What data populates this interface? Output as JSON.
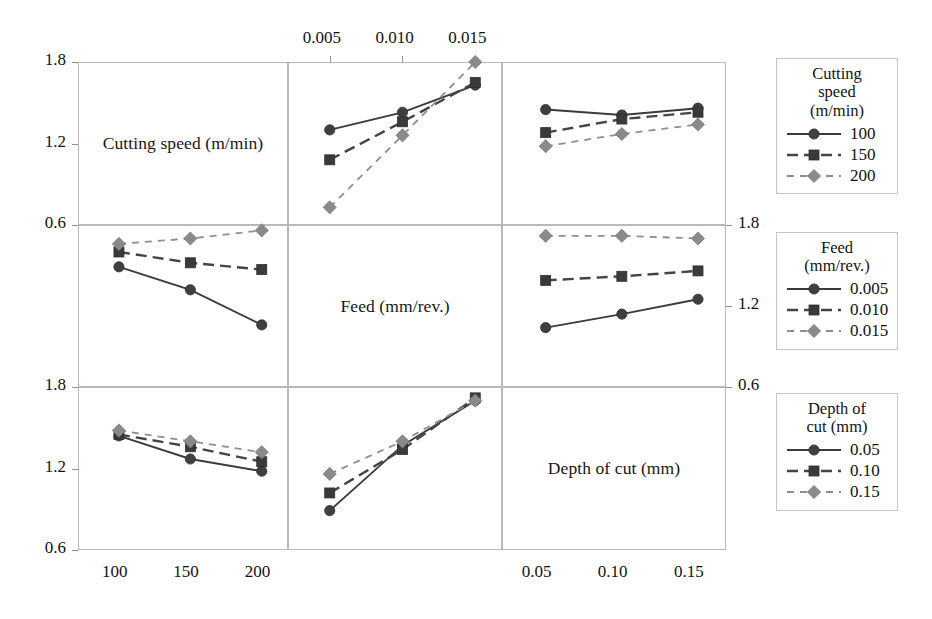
{
  "chart_data": {
    "type": "line",
    "title": "",
    "subtitle": "",
    "plot_kind": "interaction-matrix",
    "ylim": [
      0.6,
      1.8
    ],
    "yticks": [
      0.6,
      1.2,
      1.8
    ],
    "grid": true,
    "legend_position": "right",
    "factors": [
      {
        "key": "speed",
        "label": "Cutting speed (m/min)",
        "levels": [
          "100",
          "150",
          "200"
        ],
        "unit": "m/min"
      },
      {
        "key": "feed",
        "label": "Feed (mm/rev.)",
        "levels": [
          "0.005",
          "0.010",
          "0.015"
        ],
        "unit": "mm/rev."
      },
      {
        "key": "depth",
        "label": "Depth of cut (mm)",
        "levels": [
          "0.05",
          "0.10",
          "0.15"
        ],
        "unit": "mm"
      }
    ],
    "axes": {
      "top_ticks": [
        "0.005",
        "0.010",
        "0.015"
      ],
      "bottom_left_ticks": [
        "100",
        "150",
        "200"
      ],
      "bottom_right_ticks": [
        "0.05",
        "0.10",
        "0.15"
      ],
      "left_ticks_row1": [
        "1.8",
        "1.2",
        "0.6"
      ],
      "left_ticks_row3": [
        "1.8",
        "1.2",
        "0.6"
      ],
      "right_ticks_row2": [
        "1.8",
        "1.2",
        "0.6"
      ]
    },
    "panels": [
      {
        "row": 0,
        "col": 0,
        "kind": "diagonal",
        "label": "Cutting speed (m/min)"
      },
      {
        "row": 0,
        "col": 1,
        "kind": "interaction",
        "xlabel": "Feed (mm/rev.)",
        "x": [
          "0.005",
          "0.010",
          "0.015"
        ],
        "series": [
          {
            "name": "100",
            "style": "solid",
            "marker": "circle",
            "values": [
              1.3,
              1.43,
              1.63
            ]
          },
          {
            "name": "150",
            "style": "dashed",
            "marker": "square",
            "values": [
              1.08,
              1.36,
              1.65
            ]
          },
          {
            "name": "200",
            "style": "dotted",
            "marker": "diamond",
            "values": [
              0.73,
              1.26,
              1.8
            ]
          }
        ]
      },
      {
        "row": 0,
        "col": 2,
        "kind": "interaction",
        "xlabel": "Depth of cut (mm)",
        "x": [
          "0.05",
          "0.10",
          "0.15"
        ],
        "series": [
          {
            "name": "100",
            "style": "solid",
            "marker": "circle",
            "values": [
              1.45,
              1.41,
              1.46
            ]
          },
          {
            "name": "150",
            "style": "dashed",
            "marker": "square",
            "values": [
              1.28,
              1.38,
              1.43
            ]
          },
          {
            "name": "200",
            "style": "dotted",
            "marker": "diamond",
            "values": [
              1.18,
              1.27,
              1.34
            ]
          }
        ]
      },
      {
        "row": 1,
        "col": 0,
        "kind": "interaction",
        "xlabel": "Cutting speed (m/min)",
        "x": [
          "100",
          "150",
          "200"
        ],
        "series": [
          {
            "name": "0.005",
            "style": "solid",
            "marker": "circle",
            "values": [
              1.49,
              1.32,
              1.06
            ]
          },
          {
            "name": "0.010",
            "style": "dashed",
            "marker": "square",
            "values": [
              1.6,
              1.52,
              1.47
            ]
          },
          {
            "name": "0.015",
            "style": "dotted",
            "marker": "diamond",
            "values": [
              1.66,
              1.7,
              1.76
            ]
          }
        ]
      },
      {
        "row": 1,
        "col": 1,
        "kind": "diagonal",
        "label": "Feed (mm/rev.)"
      },
      {
        "row": 1,
        "col": 2,
        "kind": "interaction",
        "xlabel": "Depth of cut (mm)",
        "x": [
          "0.05",
          "0.10",
          "0.15"
        ],
        "series": [
          {
            "name": "0.005",
            "style": "solid",
            "marker": "circle",
            "values": [
              1.04,
              1.14,
              1.25
            ]
          },
          {
            "name": "0.010",
            "style": "dashed",
            "marker": "square",
            "values": [
              1.39,
              1.42,
              1.46
            ]
          },
          {
            "name": "0.015",
            "style": "dotted",
            "marker": "diamond",
            "values": [
              1.72,
              1.72,
              1.7
            ]
          }
        ]
      },
      {
        "row": 2,
        "col": 0,
        "kind": "interaction",
        "xlabel": "Cutting speed (m/min)",
        "x": [
          "100",
          "150",
          "200"
        ],
        "series": [
          {
            "name": "0.05",
            "style": "solid",
            "marker": "circle",
            "values": [
              1.44,
              1.27,
              1.18
            ]
          },
          {
            "name": "0.10",
            "style": "dashed",
            "marker": "square",
            "values": [
              1.45,
              1.36,
              1.25
            ]
          },
          {
            "name": "0.15",
            "style": "dotted",
            "marker": "diamond",
            "values": [
              1.48,
              1.4,
              1.32
            ]
          }
        ]
      },
      {
        "row": 2,
        "col": 1,
        "kind": "interaction",
        "xlabel": "Feed (mm/rev.)",
        "x": [
          "0.005",
          "0.010",
          "0.015"
        ],
        "series": [
          {
            "name": "0.05",
            "style": "solid",
            "marker": "circle",
            "values": [
              0.89,
              1.37,
              1.7
            ]
          },
          {
            "name": "0.10",
            "style": "dashed",
            "marker": "square",
            "values": [
              1.02,
              1.34,
              1.72
            ]
          },
          {
            "name": "0.15",
            "style": "dotted",
            "marker": "diamond",
            "values": [
              1.16,
              1.4,
              1.7
            ]
          }
        ]
      },
      {
        "row": 2,
        "col": 2,
        "kind": "diagonal",
        "label": "Depth of cut (mm)"
      }
    ]
  },
  "legends": [
    {
      "id": "cutting-speed",
      "title_lines": [
        "Cutting",
        "speed",
        "(m/min)"
      ],
      "entries": [
        {
          "label": "100",
          "style": "solid",
          "marker": "circle"
        },
        {
          "label": "150",
          "style": "dashed",
          "marker": "square"
        },
        {
          "label": "200",
          "style": "dotted",
          "marker": "diamond"
        }
      ]
    },
    {
      "id": "feed",
      "title_lines": [
        "Feed",
        "(mm/rev.)"
      ],
      "entries": [
        {
          "label": "0.005",
          "style": "solid",
          "marker": "circle"
        },
        {
          "label": "0.010",
          "style": "dashed",
          "marker": "square"
        },
        {
          "label": "0.015",
          "style": "dotted",
          "marker": "diamond"
        }
      ]
    },
    {
      "id": "depth-of-cut",
      "title_lines": [
        "Depth of",
        "cut (mm)"
      ],
      "entries": [
        {
          "label": "0.05",
          "style": "solid",
          "marker": "circle"
        },
        {
          "label": "0.10",
          "style": "dashed",
          "marker": "square"
        },
        {
          "label": "0.15",
          "style": "dotted",
          "marker": "diamond"
        }
      ]
    }
  ],
  "colors": {
    "series_dark": "#3b3b3b",
    "series_mid": "#444444",
    "series_light": "#8e8e8e",
    "grid": "#b9b9b9",
    "text": "#141414",
    "background": "#ffffff"
  }
}
